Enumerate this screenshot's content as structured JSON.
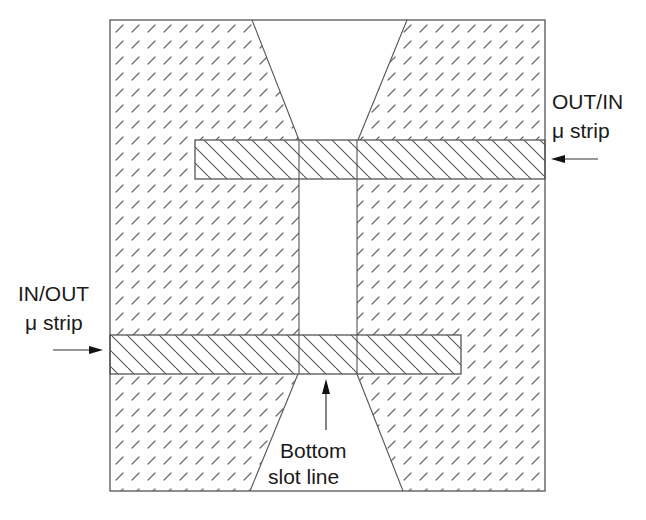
{
  "diagram": {
    "type": "microstrip-to-slotline transition (top view)",
    "colors": {
      "line": "#555555",
      "text": "#1a1a1a",
      "background": "#ffffff",
      "ground_hatch": "#6a6a6a",
      "strip_hatch": "#555555"
    },
    "labels": {
      "out_in_line1": "OUT/IN",
      "out_in_line2": "μ strip",
      "in_out_line1": "IN/OUT",
      "in_out_line2": "μ strip",
      "bottom_slot_line1": "Bottom",
      "bottom_slot_line2": "slot line"
    },
    "regions": {
      "ground_plane": "Dashed-hatch ground plane (outer square)",
      "top_slot_taper": "Tapered slot opening at top",
      "center_slot": "Vertical slot between microstrips",
      "bottom_slot_taper": "Tapered slot opening at bottom",
      "top_microstrip": "Upper microstrip (OUT/IN), extends to right edge",
      "bottom_microstrip": "Lower microstrip (IN/OUT), extends from left edge"
    },
    "arrows": [
      {
        "name": "out-in-arrow",
        "direction": "left"
      },
      {
        "name": "in-out-arrow",
        "direction": "right"
      },
      {
        "name": "bottom-slot-arrow",
        "direction": "up"
      }
    ]
  }
}
